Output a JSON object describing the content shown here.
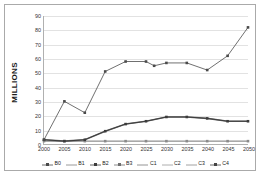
{
  "chart_data": {
    "type": "line",
    "title": "",
    "xlabel": "",
    "ylabel": "MILLIONS",
    "x": [
      2000,
      2005,
      2010,
      2015,
      2020,
      2025,
      2030,
      2035,
      2040,
      2045,
      2050
    ],
    "xticklabels": [
      "2000",
      "2005",
      "2010",
      "2015",
      "2020",
      "2025",
      "2030",
      "2035",
      "2040",
      "2045",
      "2050"
    ],
    "yticklabels": [
      "0",
      "10",
      "20",
      "30",
      "40",
      "50",
      "60",
      "70",
      "80",
      "90"
    ],
    "yticks": [
      0,
      10,
      20,
      30,
      40,
      50,
      60,
      70,
      80,
      90
    ],
    "ylim": [
      0,
      90
    ],
    "xlim": [
      2000,
      2050
    ],
    "grid": true,
    "legend_position": "bottom",
    "series": [
      {
        "name": "B0",
        "values": [
          3,
          30,
          22,
          51,
          58,
          58,
          55,
          57,
          57,
          52,
          62
        ],
        "marker": "square",
        "color": "#4a4a4a"
      },
      {
        "name": "B1",
        "values": [
          3,
          30,
          22,
          51,
          58,
          58,
          55,
          57,
          57,
          52,
          62
        ],
        "marker": "none",
        "color": "#808080"
      },
      {
        "name": "B2",
        "values": [
          3,
          2,
          3,
          9,
          14,
          16,
          19,
          19,
          18,
          16,
          16
        ],
        "marker": "square",
        "color": "#3c3c3c"
      },
      {
        "name": "B3",
        "values": [
          3,
          2,
          3,
          9,
          14,
          16,
          19,
          19,
          18,
          16,
          16
        ],
        "marker": "square",
        "color": "#6e6e6e"
      },
      {
        "name": "C1",
        "values": [
          2,
          2,
          2,
          2,
          2,
          2,
          2,
          2,
          2,
          2,
          2
        ],
        "marker": "none",
        "color": "#7a7a7a"
      },
      {
        "name": "C2",
        "values": [
          2,
          2,
          2,
          2,
          2,
          2,
          2,
          2,
          2,
          2,
          2
        ],
        "marker": "none",
        "color": "#9a9a9a"
      },
      {
        "name": "C3",
        "values": [
          2,
          2,
          2,
          2,
          2,
          2,
          2,
          2,
          2,
          2,
          2
        ],
        "marker": "square",
        "color": "#8a8a8a"
      },
      {
        "name": "C4",
        "values": [
          2,
          2,
          2,
          2,
          2,
          2,
          2,
          2,
          2,
          2,
          2
        ],
        "marker": "square",
        "color": "#444444"
      }
    ],
    "upper_line": {
      "name": "B0",
      "values": [
        3,
        30,
        22,
        51,
        58,
        58,
        55,
        57,
        57,
        52,
        62,
        82
      ],
      "x": [
        2000,
        2005,
        2010,
        2015,
        2020,
        2025,
        2027,
        2030,
        2035,
        2040,
        2045,
        2050
      ]
    }
  },
  "legend": {
    "items": [
      {
        "label": "B0",
        "marker": "square"
      },
      {
        "label": "B1",
        "marker": "line"
      },
      {
        "label": "B2",
        "marker": "square"
      },
      {
        "label": "B3",
        "marker": "square"
      },
      {
        "label": "C1",
        "marker": "line"
      },
      {
        "label": "C2",
        "marker": "line"
      },
      {
        "label": "C3",
        "marker": "line"
      },
      {
        "label": "C4",
        "marker": "square"
      }
    ]
  }
}
